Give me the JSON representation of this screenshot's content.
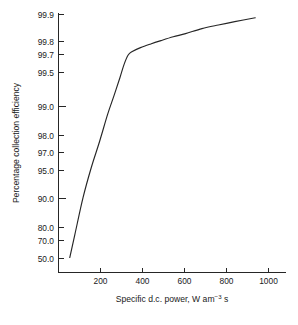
{
  "chart_data": {
    "type": "line",
    "title": "",
    "xlabel": "Specific d.c. power, W am−3 s",
    "xlabel_parts": {
      "before": "Specific d.c. power, W am",
      "exponent": "−3",
      "after": " s"
    },
    "ylabel": "Percentage collection efficiency",
    "yscale": "probability",
    "xscale": "linear",
    "xlim": [
      0,
      1110
    ],
    "ylim": [
      40.0,
      99.93
    ],
    "grid": false,
    "legend": null,
    "xticks": [
      200,
      400,
      600,
      800,
      1000
    ],
    "xtick_labels": [
      "200",
      "400",
      "600",
      "800",
      "1000"
    ],
    "yticks": [
      50.0,
      70.0,
      80.0,
      90.0,
      95.0,
      97.0,
      98.0,
      99.0,
      99.5,
      99.7,
      99.8,
      99.9
    ],
    "ytick_labels": [
      "50.0",
      "70.0",
      "80.0",
      "90.0",
      "95.0",
      "97.0",
      "98.0",
      "99.0",
      "99.5",
      "99.7",
      "99.8",
      "99.9"
    ],
    "series": [
      {
        "name": "collection efficiency",
        "x": [
          55,
          80,
          120,
          160,
          200,
          240,
          270,
          300,
          320,
          340,
          360,
          400,
          450,
          500,
          560,
          620,
          700,
          780,
          860,
          960
        ],
        "y": [
          50.5,
          62.0,
          78.0,
          87.5,
          93.0,
          96.6,
          98.0,
          98.9,
          99.3,
          99.5,
          99.56,
          99.62,
          99.67,
          99.71,
          99.75,
          99.78,
          99.82,
          99.845,
          99.865,
          99.885
        ]
      }
    ],
    "annotations": []
  },
  "figure": {
    "caption_ghost": ""
  }
}
